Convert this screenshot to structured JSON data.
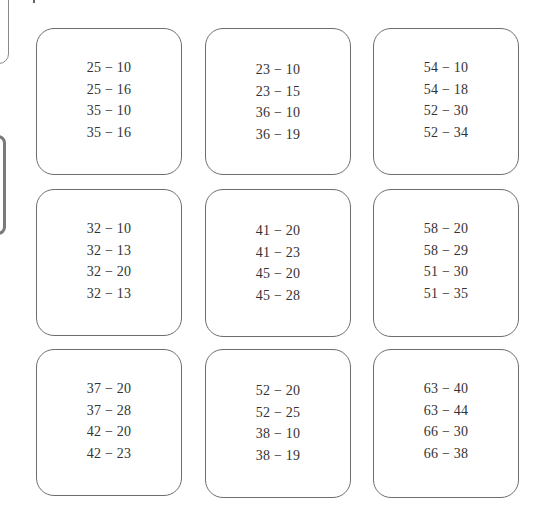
{
  "worksheet": {
    "cards": [
      {
        "problems": [
          "25 − 10",
          "25 − 16",
          "35 − 10",
          "35 − 16"
        ]
      },
      {
        "problems": [
          "23 − 10",
          "23 − 15",
          "36 − 10",
          "36 − 19"
        ]
      },
      {
        "problems": [
          "54 − 10",
          "54 − 18",
          "52 − 30",
          "52 − 34"
        ]
      },
      {
        "problems": [
          "32 − 10",
          "32 − 13",
          "32 − 20",
          "32 − 13"
        ]
      },
      {
        "problems": [
          "41 − 20",
          "41 − 23",
          "45 − 20",
          "45 − 28"
        ]
      },
      {
        "problems": [
          "58 − 20",
          "58 − 29",
          "51 − 30",
          "51 − 35"
        ]
      },
      {
        "problems": [
          "37 − 20",
          "37 − 28",
          "42 − 20",
          "42 − 23"
        ]
      },
      {
        "problems": [
          "52 − 20",
          "52 − 25",
          "38 − 10",
          "38 − 19"
        ]
      },
      {
        "problems": [
          "63 − 40",
          "63 − 44",
          "66 − 30",
          "66 − 38"
        ]
      }
    ]
  }
}
